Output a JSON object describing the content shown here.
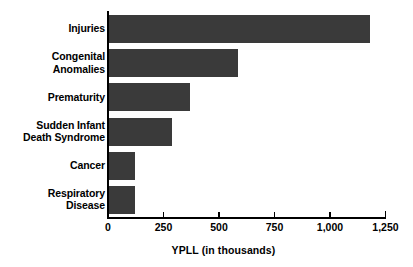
{
  "chart_data": {
    "type": "bar",
    "orientation": "horizontal",
    "title": "",
    "xlabel": "YPLL (in thousands)",
    "ylabel": "",
    "categories": [
      "Injuries",
      "Congenital\nAnomalies",
      "Prematurity",
      "Sudden Infant\nDeath Syndrome",
      "Cancer",
      "Respiratory\nDisease"
    ],
    "values": [
      1182,
      587,
      370,
      289,
      122,
      120
    ],
    "xlim": [
      0,
      1250
    ],
    "xticks": [
      0,
      250,
      500,
      750,
      1000,
      1250
    ],
    "xtick_labels": [
      "0",
      "250",
      "500",
      "750",
      "1,000",
      "1,250"
    ],
    "grid": false,
    "legend": null,
    "bar_color": "#3a3a3a",
    "axis_color": "#000000",
    "background": "#ffffff"
  },
  "axis": {
    "x_title": "YPLL (in thousands)"
  }
}
